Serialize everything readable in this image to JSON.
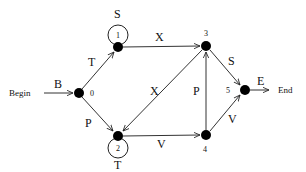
{
  "diagram": {
    "type": "finite-state-automaton",
    "start_label": "Begin",
    "end_label": "End",
    "nodes": [
      {
        "id": "0",
        "label": "0",
        "x": 79,
        "y": 93
      },
      {
        "id": "1",
        "label": "1",
        "x": 118,
        "y": 47
      },
      {
        "id": "2",
        "label": "2",
        "x": 118,
        "y": 136
      },
      {
        "id": "3",
        "label": "3",
        "x": 206,
        "y": 46
      },
      {
        "id": "4",
        "label": "4",
        "x": 206,
        "y": 135
      },
      {
        "id": "5",
        "label": "5",
        "x": 245,
        "y": 90
      }
    ],
    "edges": [
      {
        "from": "begin",
        "to": "0",
        "label": "B"
      },
      {
        "from": "0",
        "to": "1",
        "label": "T"
      },
      {
        "from": "0",
        "to": "2",
        "label": "P"
      },
      {
        "from": "1",
        "to": "1",
        "label": "S"
      },
      {
        "from": "1",
        "to": "3",
        "label": "X"
      },
      {
        "from": "2",
        "to": "2",
        "label": "T"
      },
      {
        "from": "2",
        "to": "4",
        "label": "V"
      },
      {
        "from": "3",
        "to": "2",
        "label": "X"
      },
      {
        "from": "3",
        "to": "5",
        "label": "S"
      },
      {
        "from": "4",
        "to": "3",
        "label": "P"
      },
      {
        "from": "4",
        "to": "5",
        "label": "V"
      },
      {
        "from": "5",
        "to": "end",
        "label": "E"
      }
    ]
  }
}
